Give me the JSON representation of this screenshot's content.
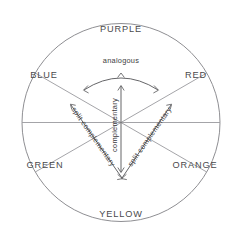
{
  "diagram": {
    "geometry": {
      "center_x": 121,
      "center_y": 122.5,
      "radius": 99,
      "sector_count": 6,
      "sector_span_degrees": 60
    },
    "colors": {
      "outline": "#8f8f93",
      "spoke": "#9a9a9e",
      "sector_label_text": "#4a4a4c",
      "annotation_line": "#5d5d60",
      "annotation_text": "#3c3c3e",
      "background": "#ffffff"
    },
    "sectors": [
      {
        "label": "PURPLE",
        "center_angle_degrees": 90,
        "label_x": 121,
        "label_y": 30
      },
      {
        "label": "RED",
        "center_angle_degrees": 30,
        "label_x": 196,
        "label_y": 76
      },
      {
        "label": "ORANGE",
        "center_angle_degrees": 330,
        "label_x": 195,
        "label_y": 166
      },
      {
        "label": "YELLOW",
        "center_angle_degrees": 270,
        "label_x": 121,
        "label_y": 215
      },
      {
        "label": "GREEN",
        "center_angle_degrees": 210,
        "label_x": 45,
        "label_y": 166
      },
      {
        "label": "BLUE",
        "center_angle_degrees": 150,
        "label_x": 44,
        "label_y": 76
      }
    ],
    "spoke_angles_degrees": [
      30,
      90,
      150,
      210,
      270,
      330
    ],
    "annotations": [
      {
        "name": "analogous",
        "label": "analogous",
        "shape": "arc",
        "label_x": 121,
        "label_y": 61,
        "rotation_degrees": 0,
        "arrow_ends": 3
      },
      {
        "name": "complementary",
        "label": "complementary",
        "shape": "vertical-double-arrow",
        "label_x": 115,
        "label_y": 125,
        "rotation_degrees": -90,
        "arrow_ends": 2
      },
      {
        "name": "split-complementary-left",
        "label": "split complementary",
        "shape": "diagonal-double-arrow",
        "label_x": 93,
        "label_y": 137,
        "rotation_degrees": 47,
        "arrow_ends": 2
      },
      {
        "name": "split-complementary-right",
        "label": "split complementary",
        "shape": "diagonal-double-arrow",
        "label_x": 150,
        "label_y": 137,
        "rotation_degrees": -47,
        "arrow_ends": 2
      }
    ]
  }
}
